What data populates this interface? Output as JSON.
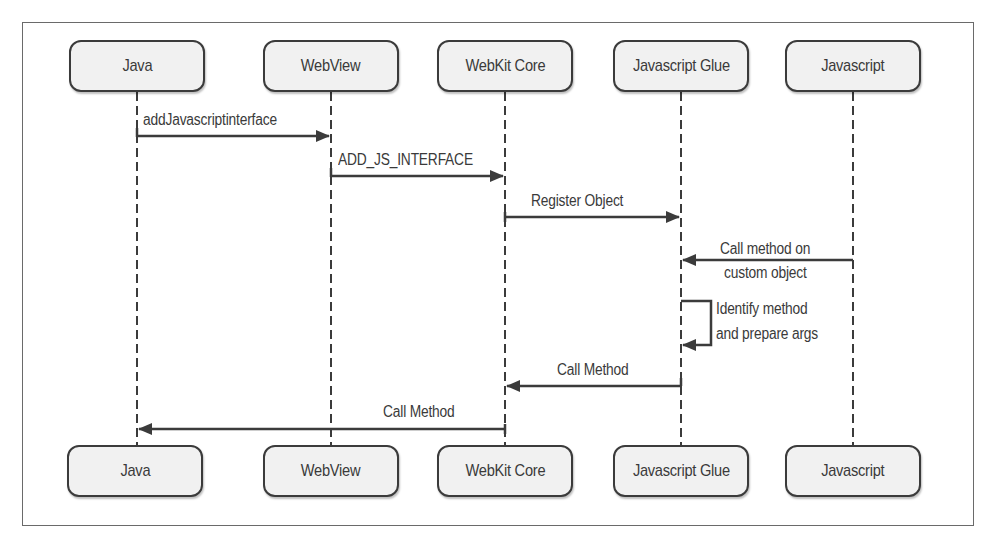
{
  "diagram": {
    "type": "sequence",
    "participants": [
      {
        "id": "java",
        "label": "Java",
        "x": 137
      },
      {
        "id": "webview",
        "label": "WebView",
        "x": 331
      },
      {
        "id": "webkit_core",
        "label": "WebKit Core",
        "x": 505
      },
      {
        "id": "javascript_glue",
        "label": "Javascript Glue",
        "x": 681
      },
      {
        "id": "javascript",
        "label": "Javascript",
        "x": 853
      }
    ],
    "messages": [
      {
        "from": "java",
        "to": "webview",
        "label": "addJavascriptinterface"
      },
      {
        "from": "webview",
        "to": "webkit_core",
        "label": "ADD_JS_INTERFACE"
      },
      {
        "from": "webkit_core",
        "to": "javascript_glue",
        "label": "Register Object"
      },
      {
        "from": "javascript",
        "to": "javascript_glue",
        "label_line1": "Call method on",
        "label_line2": "custom object"
      },
      {
        "from": "javascript_glue",
        "to": "javascript_glue",
        "label_line1": "Identify method",
        "label_line2": "and prepare args"
      },
      {
        "from": "javascript_glue",
        "to": "webkit_core",
        "label": "Call Method"
      },
      {
        "from": "webkit_core",
        "to": "java",
        "label": "Call Method"
      }
    ],
    "colors": {
      "line": "#3b3b3b",
      "box_fill": "#f1f1f1",
      "text": "#3a3a3a",
      "frame": "#6a6a6a"
    }
  }
}
